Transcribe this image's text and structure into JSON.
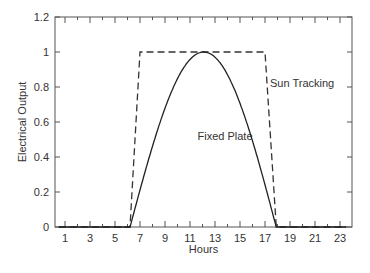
{
  "chart_data": {
    "type": "line",
    "title": "",
    "xlabel": "Hours",
    "ylabel": "Electrical Output",
    "xlim": [
      0.2,
      24
    ],
    "ylim": [
      0,
      1.2
    ],
    "x_ticks": [
      1,
      3,
      5,
      7,
      9,
      11,
      13,
      15,
      17,
      19,
      21,
      23
    ],
    "x_minor_ticks": [
      2,
      4,
      6,
      8,
      10,
      12,
      14,
      16,
      18,
      20,
      22
    ],
    "y_ticks": [
      0,
      0.2,
      0.4,
      0.6,
      0.8,
      1,
      1.2
    ],
    "y_tick_labels": [
      "0",
      "0.2",
      "0.4",
      "0.6",
      "0.8",
      "1",
      "1.2"
    ],
    "grid": false,
    "legend": "none (inline annotations)",
    "series": [
      {
        "name": "Sun Tracking",
        "style": "dashed",
        "x": [
          0.5,
          6.2,
          7,
          17,
          17.9,
          23.5
        ],
        "y": [
          0,
          0,
          1,
          1,
          0,
          0
        ]
      },
      {
        "name": "Fixed Plate",
        "style": "solid",
        "x": [
          0.5,
          6.2,
          7,
          8,
          9,
          10,
          11,
          12,
          12.1,
          13,
          14,
          15,
          16,
          17,
          17.9,
          23.5
        ],
        "y": [
          0,
          0,
          0.2,
          0.43,
          0.63,
          0.8,
          0.93,
          0.995,
          1,
          0.98,
          0.9,
          0.76,
          0.57,
          0.35,
          0,
          0
        ]
      }
    ],
    "annotations": [
      {
        "text": "Sun Tracking",
        "x": 17.4,
        "y": 0.8
      },
      {
        "text": "Fixed Plate",
        "x": 11.6,
        "y": 0.5
      }
    ]
  }
}
